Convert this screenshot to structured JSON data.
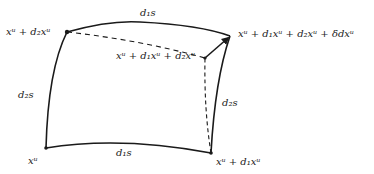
{
  "diagram": {
    "type": "curved-parallelogram",
    "stroke_color": "#1a1a1a",
    "background": "#ffffff",
    "corners": {
      "bottom_left": {
        "label": "xᵘ"
      },
      "bottom_right": {
        "label": "xᵘ + d₁xᵘ"
      },
      "top_left": {
        "label": "xᵘ + d₂xᵘ"
      },
      "top_right": {
        "label": "xᵘ + d₁xᵘ + d₂xᵘ + δdxᵘ"
      },
      "inner": {
        "label": "xᵘ + d₁xᵘ + d₂xᵘ"
      }
    },
    "edges": {
      "top": {
        "label": "d₁s",
        "style": "solid"
      },
      "bottom": {
        "label": "d₁s",
        "style": "solid"
      },
      "left": {
        "label": "d₂s",
        "style": "solid"
      },
      "right": {
        "label": "d₂s",
        "style": "solid"
      },
      "top_dashed": {
        "style": "dashed"
      },
      "right_dashed": {
        "style": "dashed"
      },
      "closure_arrow": {
        "style": "solid-arrow"
      }
    }
  }
}
